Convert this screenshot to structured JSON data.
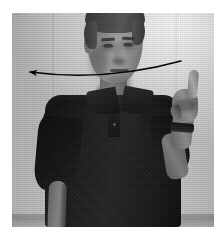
{
  "figure": {
    "caption": "",
    "kind": "grayscale-photograph",
    "subject_description": "Man in dark polo shirt with right hand raised, index finger extended",
    "canvas": {
      "width": 224,
      "height": 237,
      "background": "#ffffff"
    },
    "photo": {
      "x": 12,
      "y": 13,
      "width": 202,
      "height": 214,
      "colorspace": "grayscale",
      "background_color": "#b8b8b8",
      "shirt_color": "#1d1d23",
      "skin_color": "#8d8076",
      "hair_color": "#443c35"
    }
  },
  "annotation": {
    "type": "curved-arrow",
    "label": "",
    "color": "#0a0a0a",
    "stroke_width": 1.5,
    "direction": "right-to-left",
    "meaning": "horizontal sweeping gesture path",
    "start": {
      "x": 181,
      "y": 61
    },
    "end": {
      "x": 30,
      "y": 72
    },
    "control": {
      "x": 105,
      "y": 82
    },
    "arrowhead": {
      "x": 30,
      "y": 72,
      "size": 9,
      "style": "solid-triangle"
    }
  },
  "elements": {
    "head": "head",
    "hair": "hair",
    "face": "face",
    "neck": "neck",
    "torso": "polo-shirt",
    "collar": "shirt-collar",
    "placket": "shirt-placket",
    "left_arm": "left-arm",
    "right_arm": "right-arm-raised",
    "hand": "right-hand",
    "finger": "index-finger",
    "watch": "wristwatch",
    "wall": "wall-background",
    "floor": "floor-band"
  }
}
